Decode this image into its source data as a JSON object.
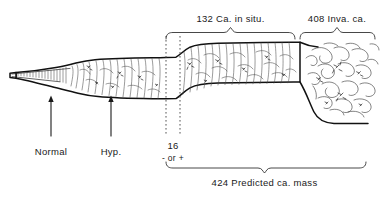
{
  "figure": {
    "type": "medical-illustration",
    "background_color": "#ffffff",
    "ink_color": "#111111"
  },
  "labels": {
    "top_left_bracket": "132 Ca. in situ.",
    "top_right_bracket": "408 Inva. ca.",
    "bottom_bracket": "424 Predicted ca. mass",
    "stage_normal": "Normal",
    "stage_hyperplasia": "Hyp.",
    "atypia_count": "16",
    "atypia_sign": "- or +"
  },
  "counts": {
    "ca_in_situ": 132,
    "invasive_ca": 408,
    "atypia_borderline": 16,
    "predicted_ca_mass": 424
  },
  "markers": {
    "arrow_normal_x": 51,
    "arrow_hyp_x": 111,
    "dotted_line_left_x": 166,
    "dotted_line_right_x": 180
  },
  "brackets": {
    "in_situ_span": [
      166,
      295
    ],
    "invasive_span": [
      300,
      375
    ],
    "predicted_span": [
      166,
      366
    ]
  }
}
